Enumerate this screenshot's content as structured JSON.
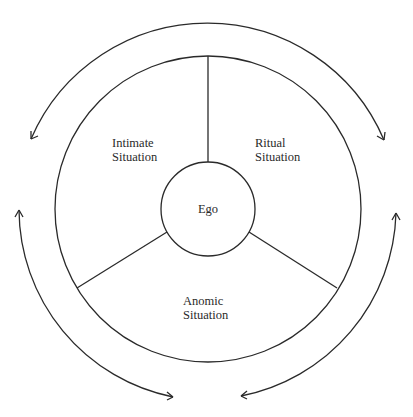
{
  "diagram": {
    "center": {
      "label": "Ego"
    },
    "sectors": [
      {
        "id": "intimate",
        "line1": "Intimate",
        "line2": "Situation"
      },
      {
        "id": "ritual",
        "line1": "Ritual",
        "line2": "Situation"
      },
      {
        "id": "anomic",
        "line1": "Anomic",
        "line2": "Situation"
      }
    ],
    "arrows": [
      {
        "id": "top-arc",
        "heads": "both"
      },
      {
        "id": "left-arc",
        "heads": "both"
      },
      {
        "id": "right-arc",
        "heads": "both"
      }
    ],
    "colors": {
      "stroke": "#2a2a2a",
      "background": "#ffffff"
    }
  }
}
